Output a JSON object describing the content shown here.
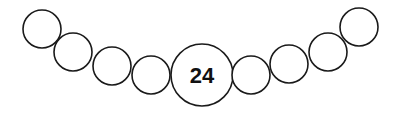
{
  "diagram": {
    "type": "bead-chain",
    "stroke_color": "#1a1a1a",
    "background": "#ffffff",
    "beads": [
      {
        "cx": 42,
        "cy": 29,
        "r": 19,
        "label": ""
      },
      {
        "cx": 73,
        "cy": 52,
        "r": 19,
        "label": ""
      },
      {
        "cx": 112,
        "cy": 66,
        "r": 19,
        "label": ""
      },
      {
        "cx": 151,
        "cy": 75,
        "r": 19,
        "label": ""
      },
      {
        "cx": 202,
        "cy": 75,
        "r": 31,
        "label": "24"
      },
      {
        "cx": 251,
        "cy": 75,
        "r": 19,
        "label": ""
      },
      {
        "cx": 289,
        "cy": 64,
        "r": 19,
        "label": ""
      },
      {
        "cx": 328,
        "cy": 52,
        "r": 19,
        "label": ""
      },
      {
        "cx": 359,
        "cy": 27,
        "r": 19,
        "label": ""
      }
    ],
    "center_label": "24"
  }
}
